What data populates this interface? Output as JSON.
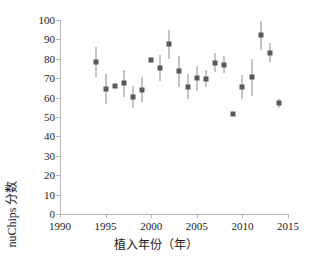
{
  "chart_data": {
    "type": "scatter",
    "title": "",
    "xlabel": "植入年份（年）",
    "ylabel": "nuChips 分数",
    "xlim": [
      1990,
      2015
    ],
    "ylim": [
      0,
      100
    ],
    "xticks": [
      1990,
      1995,
      2000,
      2005,
      2010,
      2015
    ],
    "yticks": [
      0,
      10,
      20,
      30,
      40,
      50,
      60,
      70,
      80,
      90,
      100
    ],
    "grid": false,
    "legend": null,
    "marker_color": "#595959",
    "errorbar_color": "#8b8b8b",
    "error_type": "error bars (vertical)",
    "points": [
      {
        "x": 1994,
        "y": 78.3,
        "ylow": 70.5,
        "yhigh": 86.0
      },
      {
        "x": 1995,
        "y": 64.2,
        "ylow": 56.8,
        "yhigh": 72.2
      },
      {
        "x": 1996,
        "y": 66.0,
        "ylow": 66.0,
        "yhigh": 66.0
      },
      {
        "x": 1997,
        "y": 67.4,
        "ylow": 60.5,
        "yhigh": 74.4
      },
      {
        "x": 1998,
        "y": 60.4,
        "ylow": 54.5,
        "yhigh": 66.0
      },
      {
        "x": 1999,
        "y": 64.0,
        "ylow": 57.5,
        "yhigh": 70.5
      },
      {
        "x": 2000,
        "y": 79.6,
        "ylow": 79.6,
        "yhigh": 79.6
      },
      {
        "x": 2001,
        "y": 75.4,
        "ylow": 68.4,
        "yhigh": 82.0
      },
      {
        "x": 2002,
        "y": 87.4,
        "ylow": 80.0,
        "yhigh": 95.0
      },
      {
        "x": 2003,
        "y": 73.5,
        "ylow": 65.5,
        "yhigh": 81.5
      },
      {
        "x": 2004,
        "y": 65.6,
        "ylow": 59.5,
        "yhigh": 72.0
      },
      {
        "x": 2005,
        "y": 70.1,
        "ylow": 63.5,
        "yhigh": 76.5
      },
      {
        "x": 2006,
        "y": 69.6,
        "ylow": 65.5,
        "yhigh": 74.0
      },
      {
        "x": 2007,
        "y": 78.0,
        "ylow": 73.0,
        "yhigh": 83.0
      },
      {
        "x": 2008,
        "y": 77.0,
        "ylow": 72.5,
        "yhigh": 81.5
      },
      {
        "x": 2009,
        "y": 51.5,
        "ylow": 51.5,
        "yhigh": 51.5
      },
      {
        "x": 2010,
        "y": 65.5,
        "ylow": 59.5,
        "yhigh": 71.5
      },
      {
        "x": 2011,
        "y": 70.6,
        "ylow": 61.0,
        "yhigh": 80.0
      },
      {
        "x": 2012,
        "y": 92.2,
        "ylow": 84.5,
        "yhigh": 99.5
      },
      {
        "x": 2013,
        "y": 83.2,
        "ylow": 78.5,
        "yhigh": 88.0
      },
      {
        "x": 2014,
        "y": 57.0,
        "ylow": 54.5,
        "yhigh": 59.5
      }
    ]
  },
  "caption": {
    "partial_rule": ""
  }
}
